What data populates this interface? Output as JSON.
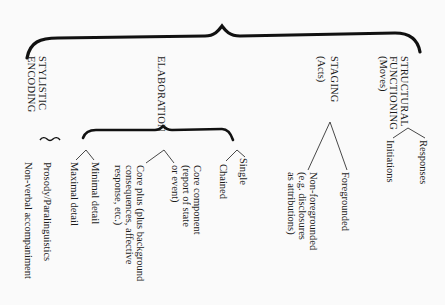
{
  "diagram": {
    "orientation": "rotated 90deg clockwise",
    "root_brace": "curly-brace-joining-four-dimensions",
    "dimensions": [
      {
        "label": "STRUCTURAL\nFUNCTIONING",
        "sub": "(Moves)",
        "children": [
          "Responses",
          "Initiations"
        ]
      },
      {
        "label": "STAGING",
        "sub": "(Acts)",
        "children": [
          "Foregrounded",
          "Non-foregrounded\n(e.g. disclosures\nas attributions)"
        ]
      },
      {
        "label": "ELABORATION",
        "sub": "",
        "groups": [
          {
            "children": [
              "Single",
              "Chained"
            ]
          },
          {
            "children": [
              "Core component\n(report of state\nor event)",
              "Core plus (plus background\nconsequences, affective\nresponse, etc.)"
            ]
          },
          {
            "children": [
              "Minimal detail",
              "Maximal detail"
            ]
          }
        ]
      },
      {
        "label": "STYLISTIC\nENCODING",
        "sub": "",
        "children": [
          "Prosody/Paralinguistics",
          "Non-verbal accompaniment"
        ]
      }
    ]
  }
}
